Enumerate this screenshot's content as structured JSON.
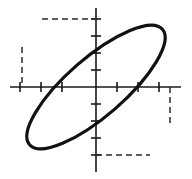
{
  "figure": {
    "background_color": "#ffffff",
    "curve_color": "#111111",
    "axis_color": "#1a1a1a",
    "guide_color": "#2a2a2a",
    "width": 192,
    "height": 179
  },
  "chart_data": {
    "type": "scatter",
    "xlabel": "",
    "ylabel": "",
    "grid": false,
    "legend": null,
    "axes": {
      "origin_px": [
        96,
        87
      ],
      "x_axis": {
        "x_start_px": 10,
        "x_end_px": 181,
        "y_px": 87
      },
      "y_axis": {
        "y_start_px": 8,
        "y_end_px": 172,
        "x_px": 96
      },
      "x_tick_spacing_px": 21,
      "y_tick_spacing_px": 17,
      "x_tick_positions_px": [
        20,
        41,
        62,
        117,
        138,
        159
      ],
      "y_tick_positions_px": [
        19,
        36,
        53,
        70,
        104,
        121,
        138,
        155
      ],
      "tick_half_length_px": 5,
      "xlim": [
        -4.1,
        4.05
      ],
      "ylim": [
        -4.65,
        4.65
      ]
    },
    "ellipse": {
      "center_px": [
        96,
        87
      ],
      "center_units": [
        0,
        0
      ],
      "semi_major_px": 88,
      "semi_minor_px": 29,
      "rotation_deg": -41,
      "orientation": "major axis descends left-to-right (negative slope)",
      "extreme_points_px": {
        "topmost": [
          42,
          19
        ],
        "bottommost": [
          150,
          155
        ],
        "leftmost": [
          22,
          47
        ],
        "rightmost": [
          170,
          127
        ]
      }
    },
    "guides": [
      {
        "name": "top-horizontal",
        "type": "dashed-horizontal",
        "x1_px": 42,
        "x2_px": 96,
        "y_px": 19
      },
      {
        "name": "left-vertical",
        "type": "dashed-vertical",
        "x_px": 22,
        "y1_px": 47,
        "y2_px": 87
      },
      {
        "name": "bottom-horizontal",
        "type": "dashed-horizontal",
        "x1_px": 96,
        "x2_px": 150,
        "y_px": 155
      },
      {
        "name": "right-vertical",
        "type": "dashed-vertical",
        "x_px": 170,
        "y1_px": 87,
        "y2_px": 127
      }
    ]
  }
}
